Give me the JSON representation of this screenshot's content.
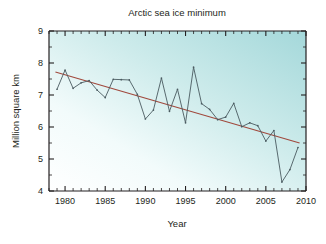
{
  "chart_data": {
    "type": "line",
    "title": "Arctic sea ice minimum",
    "xlabel": "Year",
    "ylabel": "Million square km",
    "xlim": [
      1978,
      2010
    ],
    "ylim": [
      4,
      9
    ],
    "xticks": [
      1980,
      1985,
      1990,
      1995,
      2000,
      2005,
      2010
    ],
    "xtick_labels": [
      "1980",
      "1985",
      "1990",
      "1995",
      "2000",
      "2005",
      "2010"
    ],
    "xminor_step": 1,
    "yticks": [
      4,
      5,
      6,
      7,
      8,
      9
    ],
    "ytick_labels": [
      "4",
      "5",
      "6",
      "7",
      "8",
      "9"
    ],
    "yminor_step": 0.5,
    "grid": false,
    "legend": "none",
    "x": [
      1979,
      1980,
      1981,
      1982,
      1983,
      1984,
      1985,
      1986,
      1987,
      1988,
      1989,
      1990,
      1991,
      1992,
      1993,
      1994,
      1995,
      1996,
      1997,
      1998,
      1999,
      2000,
      2001,
      2002,
      2003,
      2004,
      2005,
      2006,
      2007,
      2008,
      2009
    ],
    "series": [
      {
        "name": "Arctic sea ice minimum extent",
        "color": "#4a5a60",
        "marker": "dot",
        "values": [
          7.18,
          7.78,
          7.21,
          7.38,
          7.45,
          7.15,
          6.92,
          7.49,
          7.48,
          7.47,
          7.02,
          6.25,
          6.53,
          7.53,
          6.49,
          7.18,
          6.13,
          7.87,
          6.73,
          6.55,
          6.23,
          6.31,
          6.74,
          6.01,
          6.13,
          6.04,
          5.56,
          5.89,
          4.28,
          4.67,
          5.36
        ]
      }
    ],
    "trend_line": {
      "name": "linear trend",
      "color": "#a0483c",
      "x": [
        1978.8,
        2009.2
      ],
      "values": [
        7.72,
        5.5
      ]
    },
    "background": {
      "gradient_from": "#fdfdfd",
      "gradient_to": "#a8dadc",
      "gradient_direction": "lower-left to upper-right"
    },
    "axis_color": "#231f20"
  }
}
